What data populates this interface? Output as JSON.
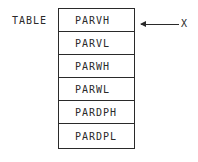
{
  "diagram": {
    "table_label": "TABLE",
    "rows": [
      "PARVH",
      "PARVL",
      "PARWH",
      "PARWL",
      "PARDPH",
      "PARDPL"
    ],
    "pointer": {
      "label": "X",
      "points_to_row": 0,
      "icon": "left-arrow-icon"
    }
  }
}
